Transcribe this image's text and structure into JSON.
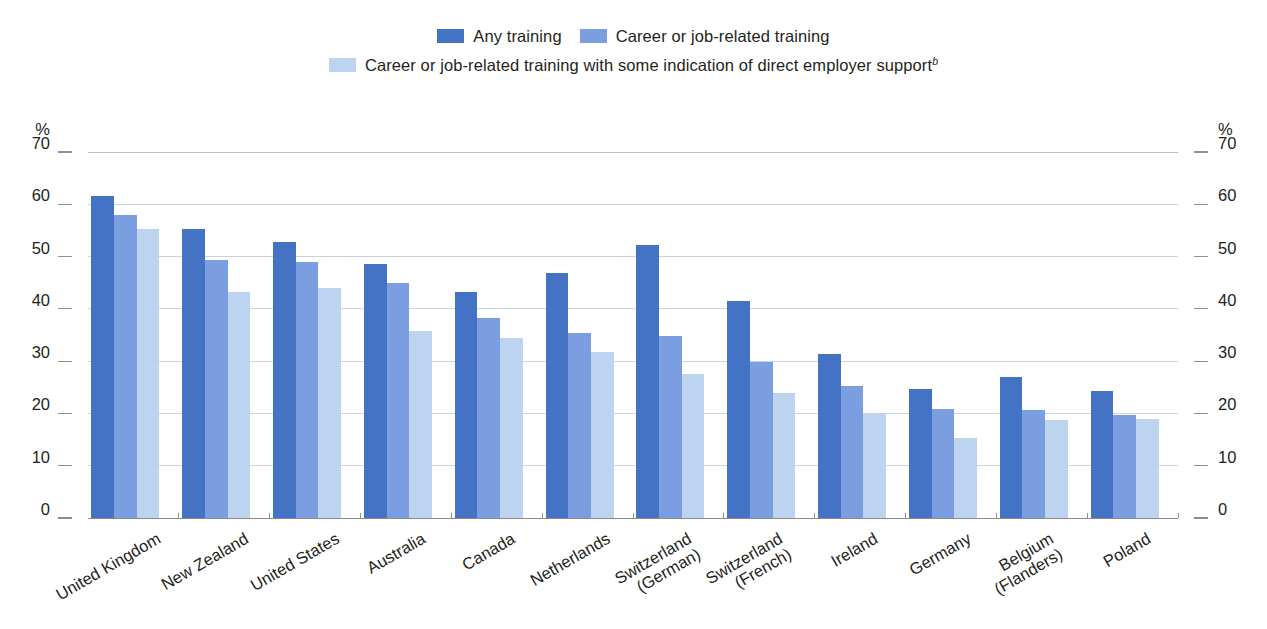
{
  "legend": {
    "rows": [
      [
        {
          "label": "Any training",
          "color": "#4472c4",
          "swatch_name": "legend-swatch-any-training"
        },
        {
          "label": "Career or job-related training",
          "color": "#7b9ee0",
          "swatch_name": "legend-swatch-career-job-related"
        }
      ],
      [
        {
          "label": "Career or job-related training with some indication of direct employer support",
          "superscript": "b",
          "color": "#bcd4f0",
          "swatch_name": "legend-swatch-employer-support"
        }
      ]
    ]
  },
  "axis": {
    "unit_label": "%",
    "ticks": [
      "70",
      "60",
      "50",
      "40",
      "30",
      "20",
      "10",
      "0"
    ],
    "min": 0,
    "max": 70,
    "step": 10
  },
  "chart_data": {
    "type": "bar",
    "title": "",
    "subtitle": "",
    "xlabel": "",
    "ylabel": "%",
    "ylim": [
      0,
      70
    ],
    "ytick_step": 10,
    "grid": true,
    "legend_position": "top-center",
    "categories": [
      "United Kingdom",
      "New Zealand",
      "United States",
      "Australia",
      "Canada",
      "Netherlands",
      "Switzerland\n(German)",
      "Switzerland\n(French)",
      "Ireland",
      "Germany",
      "Belgium\n(Flanders)",
      "Poland"
    ],
    "series": [
      {
        "name": "Any training",
        "color": "#4472c4",
        "values": [
          61.5,
          55.3,
          52.7,
          48.6,
          43.2,
          46.8,
          52.2,
          41.6,
          31.4,
          24.6,
          27.0,
          24.2
        ]
      },
      {
        "name": "Career or job-related training",
        "color": "#7b9ee0",
        "values": [
          58.0,
          49.3,
          49.0,
          44.9,
          38.2,
          35.4,
          34.9,
          29.9,
          25.3,
          20.8,
          20.6,
          19.7
        ]
      },
      {
        "name": "Career or job-related training with some indication of direct employer support",
        "color": "#bcd4f0",
        "values": [
          55.2,
          43.2,
          44.0,
          35.7,
          34.4,
          31.7,
          27.6,
          24.0,
          19.9,
          15.3,
          18.7,
          19.0
        ]
      }
    ]
  }
}
